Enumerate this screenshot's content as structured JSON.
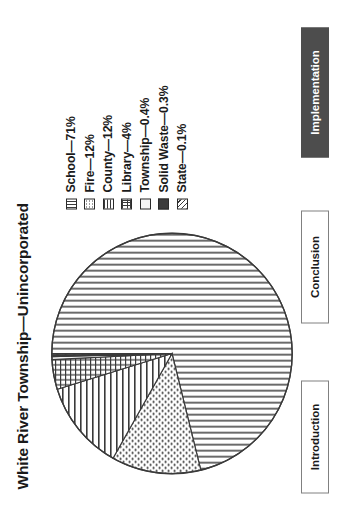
{
  "slide": {
    "title": "White River Township—Unincorporated",
    "background_color": "#ffffff"
  },
  "legend": {
    "items": [
      {
        "label": "School—71%",
        "swatch": "vertical-lines-swatch",
        "pattern": "vertical"
      },
      {
        "label": "Fire—12%",
        "swatch": "dotted-swatch",
        "pattern": "dots"
      },
      {
        "label": "County—12%",
        "swatch": "horizontal-lines-swatch",
        "pattern": "horizontal"
      },
      {
        "label": "Library—4%",
        "swatch": "grid-swatch",
        "pattern": "grid"
      },
      {
        "label": "Township—0.4%",
        "swatch": "empty-swatch",
        "pattern": "empty"
      },
      {
        "label": "Solid Waste—0.3%",
        "swatch": "solid-fill-swatch",
        "pattern": "solid"
      },
      {
        "label": "State—0.1%",
        "swatch": "diagonal-lines-swatch",
        "pattern": "diagonal"
      }
    ]
  },
  "nav": {
    "buttons": [
      {
        "label": "Introduction",
        "active": false
      },
      {
        "label": "Conclusion",
        "active": false
      },
      {
        "label": "Implementation",
        "active": true
      }
    ],
    "active_color": "#4d4d4d",
    "inactive_color": "#ffffff",
    "border_color": "#808080"
  },
  "chart_data": {
    "type": "pie",
    "title": "White River Township—Unincorporated",
    "labels": [
      "School",
      "Fire",
      "County",
      "Library",
      "Township",
      "Solid Waste",
      "State"
    ],
    "values": [
      71,
      12,
      12,
      4,
      0.4,
      0.3,
      0.1
    ],
    "value_labels": [
      "71%",
      "12%",
      "12%",
      "4%",
      "0.4%",
      "0.3%",
      "0.1%"
    ],
    "units": "percent",
    "legend_position": "right",
    "patterns": [
      "vertical",
      "dots",
      "horizontal",
      "grid",
      "empty",
      "solid",
      "diagonal"
    ],
    "start_angle_deg": -90,
    "direction": "clockwise",
    "outline_color": "#3a3a3a"
  }
}
